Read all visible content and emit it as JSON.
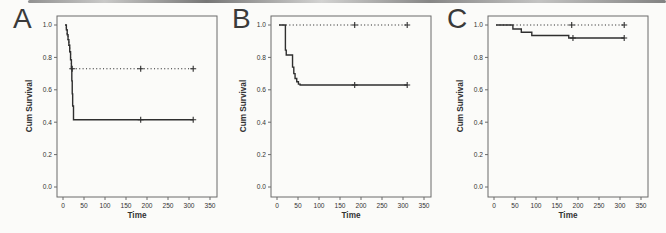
{
  "figure": {
    "kind": "kaplan-meier-survival-figure",
    "panel_count": 3
  },
  "colors": {
    "curve": "#2f2f2f",
    "frame": "#6b6b6b",
    "text": "#333333",
    "background": "#fbfbf9"
  },
  "chart_data": [
    {
      "type": "line",
      "panel_label": "A",
      "title": "",
      "xlabel": "Time",
      "ylabel": "Cum Survival",
      "xticks": [
        0,
        50,
        100,
        150,
        200,
        250,
        300,
        350
      ],
      "ytick_labels": [
        "0.0",
        "0.2",
        "0.4",
        "0.6",
        "0.8",
        "1.0"
      ],
      "xlim": [
        -15,
        365
      ],
      "ylim": [
        -0.06,
        1.06
      ],
      "grid": false,
      "legend": "none",
      "series": [
        {
          "name": "group-solid",
          "style": "solid",
          "points": [
            [
              5,
              1.0
            ],
            [
              8,
              0.97
            ],
            [
              10,
              0.94
            ],
            [
              12,
              0.91
            ],
            [
              14,
              0.875
            ],
            [
              16,
              0.835
            ],
            [
              18,
              0.785
            ],
            [
              20,
              0.73
            ],
            [
              21,
              0.655
            ],
            [
              22,
              0.575
            ],
            [
              23,
              0.5
            ],
            [
              25,
              0.415
            ],
            [
              310,
              0.415
            ]
          ],
          "censor_marks": [
            [
              185,
              0.415
            ],
            [
              310,
              0.415
            ]
          ]
        },
        {
          "name": "group-dotted",
          "style": "dotted",
          "points": [
            [
              5,
              1.0
            ],
            [
              8,
              0.97
            ],
            [
              10,
              0.94
            ],
            [
              12,
              0.91
            ],
            [
              14,
              0.875
            ],
            [
              16,
              0.835
            ],
            [
              18,
              0.785
            ],
            [
              20,
              0.73
            ],
            [
              310,
              0.73
            ]
          ],
          "censor_marks": [
            [
              22,
              0.73
            ],
            [
              185,
              0.73
            ],
            [
              310,
              0.73
            ]
          ]
        }
      ]
    },
    {
      "type": "line",
      "panel_label": "B",
      "title": "",
      "xlabel": "Time",
      "ylabel": "Cum Survival",
      "xticks": [
        0,
        50,
        100,
        150,
        200,
        250,
        300,
        350
      ],
      "ytick_labels": [
        "0.0",
        "0.2",
        "0.4",
        "0.6",
        "0.8",
        "1.0"
      ],
      "xlim": [
        -15,
        365
      ],
      "ylim": [
        -0.06,
        1.06
      ],
      "grid": false,
      "legend": "none",
      "series": [
        {
          "name": "group-solid",
          "style": "solid",
          "points": [
            [
              5,
              1.0
            ],
            [
              20,
              0.845
            ],
            [
              22,
              0.815
            ],
            [
              37,
              0.74
            ],
            [
              40,
              0.7
            ],
            [
              43,
              0.67
            ],
            [
              47,
              0.65
            ],
            [
              51,
              0.635
            ],
            [
              55,
              0.63
            ],
            [
              310,
              0.63
            ]
          ],
          "censor_marks": [
            [
              185,
              0.63
            ],
            [
              310,
              0.63
            ]
          ]
        },
        {
          "name": "group-dotted",
          "style": "dotted",
          "points": [
            [
              5,
              1.0
            ],
            [
              310,
              1.0
            ]
          ],
          "censor_marks": [
            [
              185,
              1.0
            ],
            [
              310,
              1.0
            ]
          ]
        }
      ]
    },
    {
      "type": "line",
      "panel_label": "C",
      "title": "",
      "xlabel": "Time",
      "ylabel": "Cum Survival",
      "xticks": [
        0,
        50,
        100,
        150,
        200,
        250,
        300,
        350
      ],
      "ytick_labels": [
        "0.0",
        "0.2",
        "0.4",
        "0.6",
        "0.8",
        "1.0"
      ],
      "xlim": [
        -15,
        365
      ],
      "ylim": [
        -0.06,
        1.06
      ],
      "grid": false,
      "legend": "none",
      "series": [
        {
          "name": "group-solid",
          "style": "solid",
          "points": [
            [
              5,
              1.0
            ],
            [
              45,
              0.975
            ],
            [
              65,
              0.955
            ],
            [
              90,
              0.935
            ],
            [
              178,
              0.92
            ],
            [
              310,
              0.92
            ]
          ],
          "censor_marks": [
            [
              188,
              0.92
            ],
            [
              310,
              0.92
            ]
          ]
        },
        {
          "name": "group-dotted",
          "style": "dotted",
          "points": [
            [
              5,
              1.0
            ],
            [
              310,
              1.0
            ]
          ],
          "censor_marks": [
            [
              185,
              1.0
            ],
            [
              310,
              1.0
            ]
          ]
        }
      ]
    }
  ]
}
